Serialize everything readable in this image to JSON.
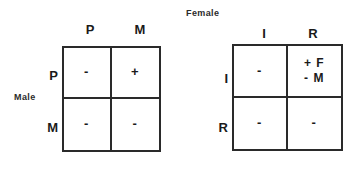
{
  "figure": {
    "background_color": "#ffffff",
    "line_color": "#2a2a2a",
    "text_color": "#1a1a1a"
  },
  "left_matrix": {
    "name": "male-matrix",
    "row_group_label": "Male",
    "column_headers": [
      "P",
      "M"
    ],
    "row_labels": [
      "P",
      "M"
    ],
    "cells": [
      {
        "id": "row-P-col-P",
        "lines": [
          "-"
        ]
      },
      {
        "id": "row-P-col-M",
        "lines": [
          "+"
        ]
      },
      {
        "id": "row-M-col-P",
        "lines": [
          "-"
        ]
      },
      {
        "id": "row-M-col-M",
        "lines": [
          "-"
        ]
      }
    ]
  },
  "right_matrix": {
    "name": "female-matrix",
    "column_group_label": "Female",
    "column_headers": [
      "I",
      "R"
    ],
    "row_labels": [
      "I",
      "R"
    ],
    "cells": [
      {
        "id": "row-I-col-I",
        "lines": [
          "-"
        ]
      },
      {
        "id": "row-I-col-R",
        "lines": [
          "+ F",
          "- M"
        ]
      },
      {
        "id": "row-R-col-I",
        "lines": [
          "-"
        ]
      },
      {
        "id": "row-R-col-R",
        "lines": [
          "-"
        ]
      }
    ]
  }
}
